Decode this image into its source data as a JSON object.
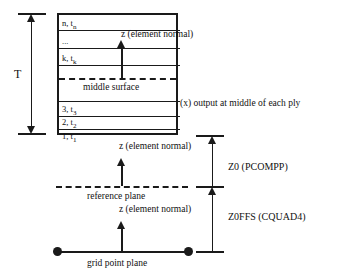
{
  "figure": {
    "thickness_label": "T",
    "plies": [
      {
        "id": "n",
        "label_main": "n, t",
        "label_sub": "n"
      },
      {
        "id": "dots",
        "label_main": "...",
        "label_sub": ""
      },
      {
        "id": "k",
        "label_main": "k, t",
        "label_sub": "k"
      },
      {
        "id": "3",
        "label_main": "3, t",
        "label_sub": "3"
      },
      {
        "id": "2",
        "label_main": "2, t",
        "label_sub": "2"
      },
      {
        "id": "1",
        "label_main": "1, t",
        "label_sub": "1"
      }
    ],
    "annotations": {
      "element_normal_top": "z (element normal)",
      "element_normal_upper": "z (element normal)",
      "element_normal_lower": "z (element normal)",
      "middle_surface": "middle surface",
      "ply_output": "(x) output at middle of each ply",
      "reference_plane": "reference plane",
      "grid_point_plane": "grid point plane"
    },
    "dimensions": {
      "z0": "Z0 (PCOMPP)",
      "z0ffs": "Z0FFS (CQUAD4)"
    },
    "colors": {
      "line": "#1a1a1a",
      "background": "#ffffff"
    }
  }
}
